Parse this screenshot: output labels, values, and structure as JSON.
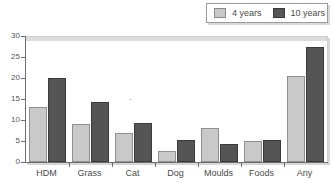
{
  "chart_data": {
    "type": "bar",
    "title": "",
    "xlabel": "",
    "ylabel": "",
    "ylim": [
      0,
      30
    ],
    "ytick_step": 5,
    "grid": false,
    "legend_position": "top-right",
    "categories": [
      "HDM",
      "Grass",
      "Cat",
      "Dog",
      "Moulds",
      "Foods",
      "Any"
    ],
    "series": [
      {
        "name": "4 years",
        "color": "#c9c9c9",
        "values": [
          13.0,
          9.0,
          6.8,
          2.7,
          8.0,
          5.0,
          20.4
        ]
      },
      {
        "name": "10 years",
        "color": "#555555",
        "values": [
          20.0,
          14.4,
          9.2,
          5.3,
          4.2,
          5.3,
          27.5
        ]
      }
    ],
    "ytick_labels": [
      "0",
      "5",
      "10",
      "15",
      "20",
      "25",
      "30"
    ]
  },
  "legend": {
    "entries": [
      {
        "label": "4 years",
        "color": "#c9c9c9"
      },
      {
        "label": "10 years",
        "color": "#555555"
      }
    ]
  },
  "axes": {
    "y_ticks": [
      "30",
      "25",
      "20",
      "15",
      "10",
      "5",
      "0"
    ],
    "x_categories": [
      "HDM",
      "Grass",
      "Cat",
      "Dog",
      "Moulds",
      "Foods",
      "Any"
    ]
  }
}
